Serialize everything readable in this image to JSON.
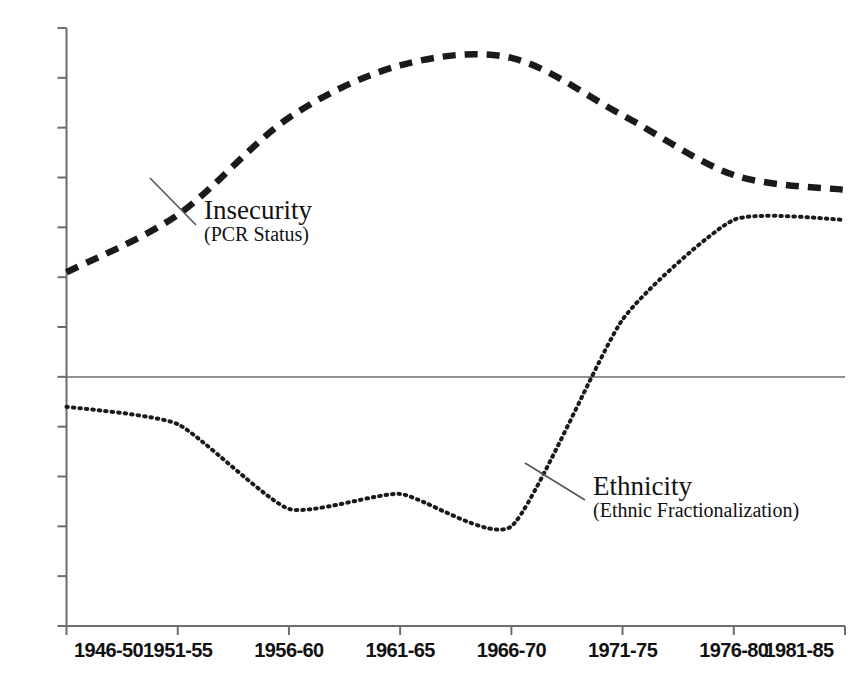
{
  "chart_data": {
    "type": "line",
    "title": "",
    "subtitle": "",
    "xlabel": "",
    "ylabel": "",
    "categories": [
      "1946-50",
      "1951-55",
      "1956-60",
      "1961-65",
      "1966-70",
      "1971-75",
      "1976-80",
      "1981-85"
    ],
    "ylim": [
      -0.5,
      0.7
    ],
    "yticks": [
      0.7,
      0.6,
      0.5,
      0.4,
      0.3,
      0.2,
      0.1,
      0,
      -0.1,
      -0.2,
      -0.3,
      -0.4,
      -0.5
    ],
    "ytick_labels": [
      "0.7",
      "0.6",
      "0.5",
      "0.4",
      "0.3",
      "0.2",
      "0.1",
      "0",
      "-0.1",
      "-0.2",
      "-0.3",
      "-0.4",
      "-0.5"
    ],
    "grid": false,
    "zero_line": true,
    "legend_position": "inline-annotations",
    "series": [
      {
        "name": "Insecurity",
        "sublabel": "(PCR Status)",
        "style": "dashed",
        "color": "#1a1a1a",
        "values": [
          0.21,
          0.325,
          0.52,
          0.625,
          0.64,
          0.525,
          0.405,
          0.375
        ]
      },
      {
        "name": "Ethnicity",
        "sublabel": "(Ethnic Fractionalization)",
        "style": "dotted",
        "color": "#1a1a1a",
        "values": [
          -0.06,
          -0.095,
          -0.265,
          -0.235,
          -0.3,
          0.115,
          0.315,
          0.315
        ]
      }
    ],
    "annotations": [
      {
        "label": "Insecurity",
        "sublabel": "(PCR Status)",
        "text_x": 204,
        "text_y": 196,
        "leader_from_x": 150,
        "leader_from_y": 178,
        "leader_to_x": 196,
        "leader_to_y": 225
      },
      {
        "label": "Ethnicity",
        "sublabel": "(Ethnic Fractionalization)",
        "text_x": 593,
        "text_y": 472,
        "leader_from_x": 525,
        "leader_from_y": 463,
        "leader_to_x": 585,
        "leader_to_y": 500
      }
    ]
  },
  "axes": {
    "left_axis_color": "#6d6d6d",
    "bottom_axis_color": "#6d6d6d",
    "zero_line_color": "#6d6d6d"
  }
}
